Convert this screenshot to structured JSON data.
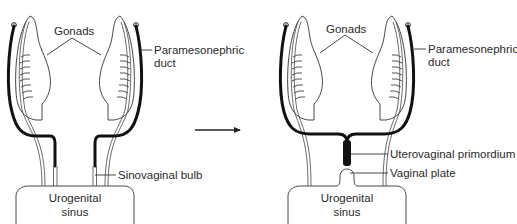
{
  "panels": [
    {
      "stage": "before",
      "labels": {
        "gonads": "Gonads",
        "paramesonephric_duct_line1": "Paramesonephric",
        "paramesonephric_duct_line2": "duct",
        "sinovaginal_bulb": "Sinovaginal bulb",
        "urogenital_sinus_line1": "Urogenital",
        "urogenital_sinus_line2": "sinus"
      }
    },
    {
      "stage": "after",
      "labels": {
        "gonads": "Gonads",
        "paramesonephric_duct_line1": "Paramesonephric",
        "paramesonephric_duct_line2": "duct",
        "uterovaginal_primordium": "Uterovaginal primordium",
        "vaginal_plate": "Vaginal plate",
        "urogenital_sinus_line1": "Urogenital",
        "urogenital_sinus_line2": "sinus"
      }
    }
  ],
  "transition_arrow": "right-arrow"
}
